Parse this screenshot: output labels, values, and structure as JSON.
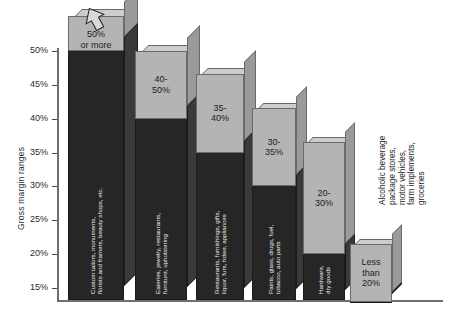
{
  "chart_data": {
    "type": "bar",
    "title": "",
    "subtitle": "",
    "xlabel": "",
    "ylabel": "Gross margin ranges",
    "ylim": [
      13.0,
      53.0
    ],
    "grid": false,
    "legend": "none",
    "orientation": "vertical",
    "style": "3d-bars-descending",
    "tick_labels": [
      "50%",
      "45%",
      "40%",
      "35%",
      "30%",
      "25%",
      "20%",
      "15%"
    ],
    "tick_values": [
      50,
      45,
      40,
      35,
      30,
      25,
      20,
      15
    ],
    "categories": [
      "Custom tailors, monuments, florists and framers, beauty shops, etc.",
      "Eateries, jewelry, restaurants, furniture, upholstering",
      "Restaurants, furnishings, gifts, liquor, furs, hdwe, appliances",
      "Paints, glass, drugs, fuel, tobacco, auto parts",
      "Hardware, dry goods",
      "Alcoholic beverage package stores, motor vehicles, farm implements, groceries"
    ],
    "values": [
      50,
      50,
      40,
      35,
      30,
      20
    ],
    "band_labels": [
      "50%\nor more",
      "40-\n50%",
      "35-\n40%",
      "30-\n35%",
      "20-\n30%",
      "Less\nthan\n20%"
    ],
    "band_lower": [
      50,
      40,
      35,
      30,
      20,
      13
    ],
    "band_upper": [
      53,
      50,
      40,
      35,
      30,
      20
    ],
    "annotations": [
      {
        "name": "up-arrow",
        "target": "bar-1",
        "meaning": "50% or more, open ended"
      }
    ]
  },
  "axis": {
    "y_title": "Gross margin ranges"
  },
  "bars": [
    {
      "id": "bar-1",
      "band_label": "50%\nor more",
      "category": "Custom tailors, monuments,\nflorists and framers, beauty shops, etc.",
      "value": 50,
      "has_arrow": true
    },
    {
      "id": "bar-2",
      "band_label": "40-\n50%",
      "category": "Eateries, jewelry, restaurants,\nfurniture, upholstering",
      "value": 50,
      "has_arrow": false
    },
    {
      "id": "bar-3",
      "band_label": "35-\n40%",
      "category": "Restaurants, furnishings, gifts,\nliquor, furs, hdwe, appliances",
      "value": 40,
      "has_arrow": false
    },
    {
      "id": "bar-4",
      "band_label": "30-\n35%",
      "category": "Paints, glass, drugs, fuel,\ntobacco, auto parts",
      "value": 35,
      "has_arrow": false
    },
    {
      "id": "bar-5",
      "band_label": "20-\n30%",
      "category": "Hardware,\ndry goods",
      "value": 30,
      "has_arrow": false
    },
    {
      "id": "bar-6",
      "band_label": "Less\nthan\n20%",
      "category": "",
      "value": 20,
      "has_arrow": false
    }
  ],
  "outer_note": {
    "text": "Alcoholic beverage package stores,\nmotor vehicles, farm implements, groceries"
  },
  "colors": {
    "cap": "#b4b4b4",
    "cap_side": "#9a9a9a",
    "cap_top": "#cdcdcd",
    "body": "#262626",
    "body_side": "#3a3a3a",
    "outline": "#6a6a6a",
    "axis": "#6e6e6e",
    "text": "#1d1d1d",
    "inverse_text": "#efefef"
  }
}
